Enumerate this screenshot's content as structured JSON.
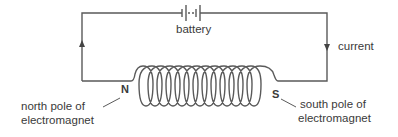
{
  "diagram": {
    "labels": {
      "battery": "battery",
      "current": "current",
      "north_pole": "N",
      "south_pole": "S",
      "north_desc_line1": "north pole of",
      "north_desc_line2": "electromagnet",
      "south_desc_line1": "south pole of",
      "south_desc_line2": "electromagnet"
    },
    "colors": {
      "wire": "#555555",
      "text": "#3a3a3a",
      "background": "#ffffff"
    },
    "coil": {
      "loops": 10
    }
  }
}
